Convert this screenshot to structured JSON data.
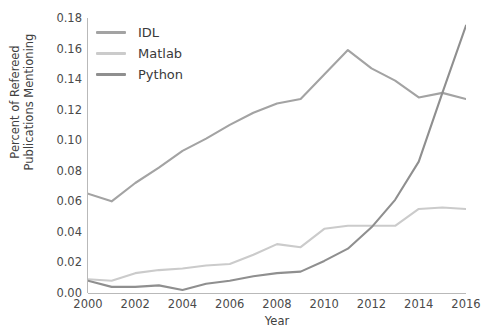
{
  "chart_data": {
    "type": "line",
    "title": "",
    "xlabel": "Year",
    "ylabel": "Percent of Refereed Publications Mentioning",
    "ylabel_line1": "Percent of Refereed",
    "ylabel_line2": "Publications Mentioning",
    "x": [
      2000,
      2001,
      2002,
      2003,
      2004,
      2005,
      2006,
      2007,
      2008,
      2009,
      2010,
      2011,
      2012,
      2013,
      2014,
      2015,
      2016
    ],
    "xlim": [
      2000,
      2016
    ],
    "ylim": [
      0.0,
      0.18
    ],
    "xticks": [
      2000,
      2002,
      2004,
      2006,
      2008,
      2010,
      2012,
      2014,
      2016
    ],
    "xtick_labels": [
      "2000",
      "2002",
      "2004",
      "2006",
      "2008",
      "2010",
      "2012",
      "2014",
      "2016"
    ],
    "yticks": [
      0.0,
      0.02,
      0.04,
      0.06,
      0.08,
      0.1,
      0.12,
      0.14,
      0.16,
      0.18
    ],
    "ytick_labels": [
      "0.00",
      "0.02",
      "0.04",
      "0.06",
      "0.08",
      "0.10",
      "0.12",
      "0.14",
      "0.16",
      "0.18"
    ],
    "grid": false,
    "legend_position": "upper left",
    "series": [
      {
        "name": "IDL",
        "color": "#a3a3a3",
        "values": [
          0.065,
          0.06,
          0.072,
          0.082,
          0.093,
          0.101,
          0.11,
          0.118,
          0.124,
          0.127,
          0.143,
          0.159,
          0.147,
          0.139,
          0.128,
          0.131,
          0.127
        ]
      },
      {
        "name": "Matlab",
        "color": "#cbcbcb",
        "values": [
          0.009,
          0.008,
          0.013,
          0.015,
          0.016,
          0.018,
          0.019,
          0.025,
          0.032,
          0.03,
          0.042,
          0.044,
          0.044,
          0.044,
          0.055,
          0.056,
          0.055
        ]
      },
      {
        "name": "Python",
        "color": "#8f8f8f",
        "values": [
          0.008,
          0.004,
          0.004,
          0.005,
          0.002,
          0.006,
          0.008,
          0.011,
          0.013,
          0.014,
          0.021,
          0.029,
          0.043,
          0.061,
          0.086,
          0.131,
          0.175
        ]
      }
    ]
  },
  "legend": {
    "items": [
      {
        "label": "IDL"
      },
      {
        "label": "Matlab"
      },
      {
        "label": "Python"
      }
    ]
  }
}
